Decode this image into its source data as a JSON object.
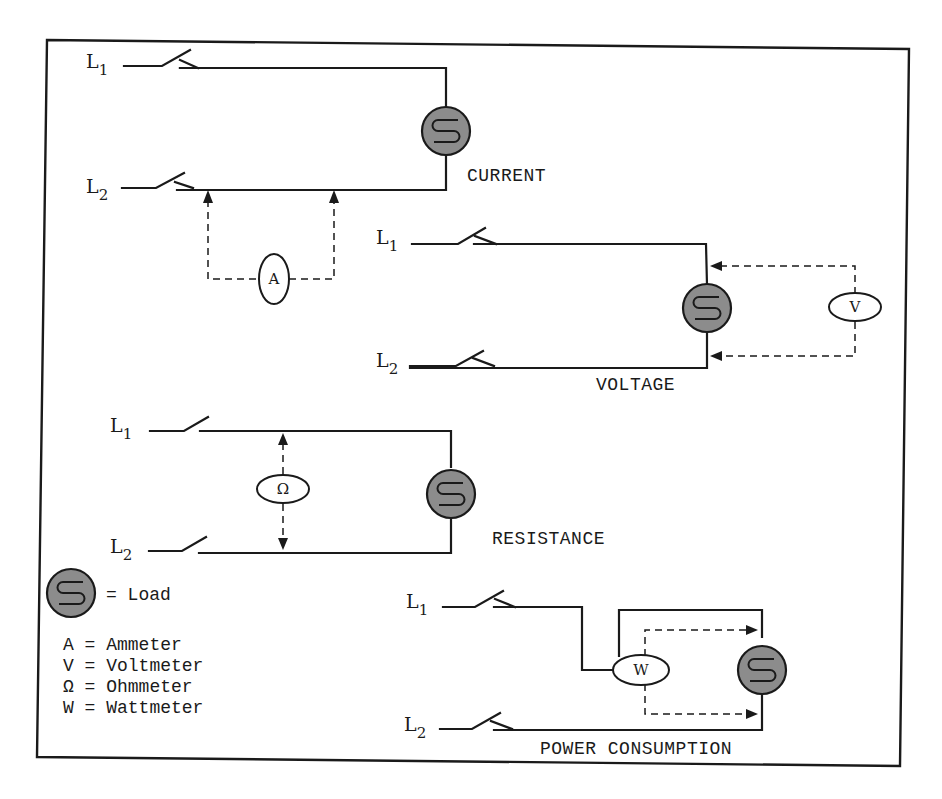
{
  "diagram": {
    "lines": {
      "l1": "L",
      "l1_sub": "1",
      "l2": "L",
      "l2_sub": "2"
    },
    "circuits": [
      {
        "id": "current",
        "caption": "CURRENT",
        "meter_symbol": "A",
        "meter_connection": "series on L2"
      },
      {
        "id": "voltage",
        "caption": "VOLTAGE",
        "meter_symbol": "V",
        "meter_connection": "parallel across load"
      },
      {
        "id": "resistance",
        "caption": "RESISTANCE",
        "meter_symbol": "Ω",
        "meter_connection": "across L1-L2"
      },
      {
        "id": "power",
        "caption": "POWER CONSUMPTION",
        "meter_symbol": "W",
        "meter_connection": "series L1 + parallel load"
      }
    ],
    "legend": {
      "load_label": "= Load",
      "items": [
        {
          "symbol": "A",
          "text": "A = Ammeter"
        },
        {
          "symbol": "V",
          "text": "V = Voltmeter"
        },
        {
          "symbol": "Ω",
          "text": "Ω = Ohmmeter"
        },
        {
          "symbol": "W",
          "text": "W = Wattmeter"
        }
      ]
    },
    "colors": {
      "ink": "#1a1a1a",
      "load_fill": "#8c8c8c",
      "background": "#ffffff"
    }
  }
}
